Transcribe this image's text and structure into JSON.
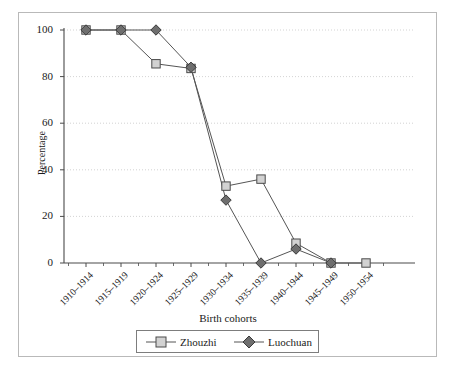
{
  "chart_data": {
    "type": "line",
    "title": "",
    "subtitle": "",
    "xlabel": "Birth cohorts",
    "ylabel": "Percentage",
    "categories": [
      "1910–1914",
      "1915–1919",
      "1920–1924",
      "1925–1929",
      "1930–1934",
      "1935–1939",
      "1940–1944",
      "1945–1949",
      "1950–1954"
    ],
    "series": [
      {
        "name": "Zhouzhi",
        "marker": "square",
        "marker_fill": "#d2d2d2",
        "marker_stroke": "#4a4a4a",
        "line_color": "#555555",
        "values": [
          100,
          100,
          85.5,
          83.5,
          33,
          36,
          8.5,
          0,
          0
        ]
      },
      {
        "name": "Luochuan",
        "marker": "diamond",
        "marker_fill": "#6e6e6e",
        "marker_stroke": "#3a3a3a",
        "line_color": "#555555",
        "values": [
          100,
          100,
          100,
          84,
          27,
          0,
          6,
          0,
          null
        ]
      }
    ],
    "ylim": [
      0,
      100
    ],
    "yticks": [
      0,
      20,
      40,
      60,
      80,
      100
    ],
    "ytick_labels": [
      "0",
      "20",
      "40",
      "60",
      "80",
      "100"
    ],
    "grid": "horizontal-dotted",
    "legend_position": "bottom-center",
    "legend_entries": [
      "Zhouzhi",
      "Luochuan"
    ]
  },
  "axes": {
    "y_title": "Percentage",
    "x_title": "Birth cohorts"
  },
  "legend": {
    "items": [
      {
        "label": "Zhouzhi"
      },
      {
        "label": "Luochuan"
      }
    ]
  },
  "colors": {
    "frame": "#b9b9b9",
    "axis": "#4a4a4a",
    "grid": "#c8c8c8",
    "zhouzhi_fill": "#d2d2d2",
    "luochuan_fill": "#6e6e6e",
    "line": "#555555",
    "text": "#1a1a1a"
  }
}
